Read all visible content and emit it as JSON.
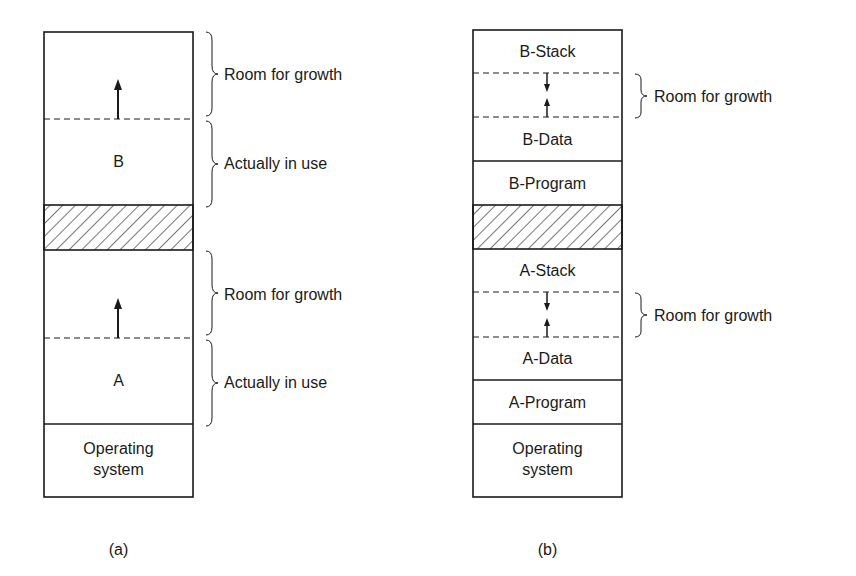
{
  "figure_a": {
    "caption": "(a)",
    "segments": {
      "b_label": "B",
      "a_label": "A",
      "os_label_line1": "Operating",
      "os_label_line2": "system"
    },
    "braces": [
      {
        "label": "Room for growth"
      },
      {
        "label": "Actually in use"
      },
      {
        "label": "Room for growth"
      },
      {
        "label": "Actually in use"
      }
    ]
  },
  "figure_b": {
    "caption": "(b)",
    "segments": {
      "b_stack": "B-Stack",
      "b_data": "B-Data",
      "b_program": "B-Program",
      "a_stack": "A-Stack",
      "a_data": "A-Data",
      "a_program": "A-Program",
      "os_label_line1": "Operating",
      "os_label_line2": "system"
    },
    "braces": [
      {
        "label": "Room for growth"
      },
      {
        "label": "Room for growth"
      }
    ]
  },
  "colors": {
    "line": "#1a1a1a",
    "background": "#ffffff"
  }
}
